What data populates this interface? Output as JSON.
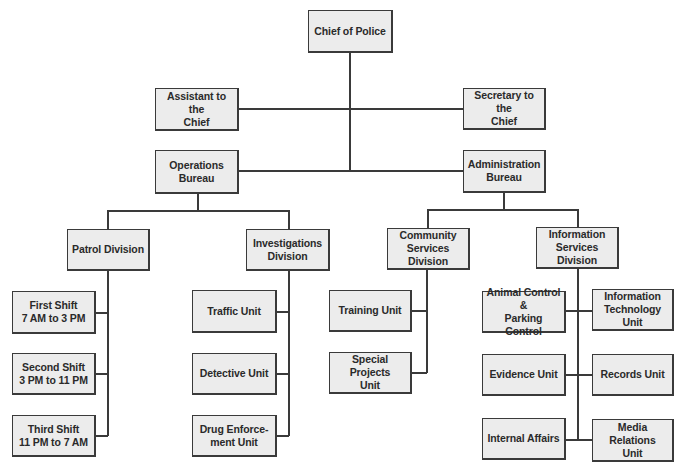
{
  "colors": {
    "box_fill": "#ececec",
    "line": "#3a3a3a",
    "text": "#2a2a2a"
  },
  "nodes": {
    "chief": "Chief of Police",
    "assistant": "Assistant to the\nChief",
    "secretary": "Secretary to the\nChief",
    "operations": "Operations\nBureau",
    "administration": "Administration\nBureau",
    "patrol": "Patrol Division",
    "investigations": "Investigations\nDivision",
    "community": "Community\nServices Division",
    "information": "Information\nServices Division",
    "first_shift": "First Shift\n7 AM to 3 PM",
    "second_shift": "Second Shift\n3 PM to 11 PM",
    "third_shift": "Third Shift\n11 PM to 7  AM",
    "traffic": "Traffic Unit",
    "detective": "Detective Unit",
    "drug": "Drug Enforce-\nment Unit",
    "training": "Training Unit",
    "special_projects": "Special Projects\nUnit",
    "animal_control": "Animal Control &\nParking Control",
    "it": "Information\nTechnology Unit",
    "evidence": "Evidence Unit",
    "records": "Records Unit",
    "internal_affairs": "Internal Affairs",
    "media_relations": "Media Relations\nUnit"
  },
  "hierarchy": {
    "Chief of Police": {
      "staff": [
        "Assistant to the Chief",
        "Secretary to the Chief"
      ],
      "Operations Bureau": {
        "Patrol Division": [
          "First Shift 7 AM to 3 PM",
          "Second Shift 3 PM to 11 PM",
          "Third Shift 11 PM to 7 AM"
        ],
        "Investigations Division": [
          "Traffic Unit",
          "Detective Unit",
          "Drug Enforcement Unit"
        ]
      },
      "Administration Bureau": {
        "Community Services Division": [
          "Training Unit",
          "Special Projects Unit"
        ],
        "Information Services Division": [
          "Animal Control & Parking Control",
          "Information Technology Unit",
          "Evidence Unit",
          "Records Unit",
          "Internal Affairs",
          "Media Relations Unit"
        ]
      }
    }
  }
}
